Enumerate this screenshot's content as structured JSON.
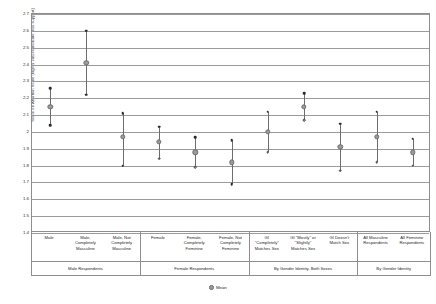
{
  "chart_data": {
    "type": "scatter",
    "title": "",
    "xlabel": "",
    "ylabel": "Score on Abortion Scale (higher values indicate less support)",
    "ylim": [
      1.4,
      2.7
    ],
    "ytick_labels": [
      "2.7",
      "2.6",
      "2.5",
      "2.4",
      "2.3",
      "2.2",
      "2.1",
      "2",
      "1.9",
      "1.8",
      "1.7",
      "1.6",
      "1.5",
      "1.4"
    ],
    "ytick_values": [
      2.7,
      2.6,
      2.5,
      2.4,
      2.3,
      2.2,
      2.1,
      2.0,
      1.9,
      1.8,
      1.7,
      1.6,
      1.5,
      1.4
    ],
    "grid": true,
    "legend": {
      "position": "bottom",
      "entries": [
        "Mean"
      ]
    },
    "categories": [
      "Male",
      "Male, Completely Masculine",
      "Male, Not Completely Masculine",
      "Female",
      "Female, Completely Feminine",
      "Female, Not Completely Feminine",
      "GI \"Completely\" Matches Sex",
      "GI \"Mostly\" or \"Slightly\" Matches Sex",
      "GI Doesn't Match Sex",
      "All Masculine Respondents",
      "All Feminine Respondents"
    ],
    "series": [
      {
        "name": "Upper",
        "values": [
          2.26,
          2.6,
          2.11,
          2.03,
          1.97,
          1.95,
          2.12,
          2.23,
          2.05,
          2.12,
          1.96
        ]
      },
      {
        "name": "Mean",
        "values": [
          2.15,
          2.41,
          1.97,
          1.94,
          1.88,
          1.82,
          2.0,
          2.15,
          1.91,
          1.97,
          1.88
        ]
      },
      {
        "name": "Lower",
        "values": [
          2.04,
          2.22,
          1.8,
          1.84,
          1.79,
          1.69,
          1.88,
          2.07,
          1.77,
          1.82,
          1.8
        ]
      }
    ]
  },
  "axis": {
    "y_title": "Score on Abortion Scale (higher values indicate less support)",
    "category_labels": [
      "Male",
      "Male,\nCompletely\nMasculine",
      "Male, Not\nCompletely\nMasculine",
      "Female",
      "Female,\nCompletely\nFeminine",
      "Female, Not\nCompletely\nFeminine",
      "GI\n\"Completely\"\nMatches Sex",
      "GI \"Mostly\" or\n\"Slightly\"\nMatches Sex",
      "GI Doesn't\nMatch Sex",
      "All Masculine\nRespondents",
      "All Feminine\nRespondents"
    ],
    "group_labels": [
      "Male Respondents",
      "Female Respondents",
      "By Gender Identity, Both Sexes",
      "By Gender Identity"
    ]
  },
  "legend": {
    "mean_label": "Mean"
  },
  "colors": {
    "mean_marker": "#9a9a9a",
    "cap_marker": "#2b2b2b",
    "range_line": "#6d6d6d",
    "grid": "#9b9b9b",
    "frame": "#8e8e8e"
  }
}
